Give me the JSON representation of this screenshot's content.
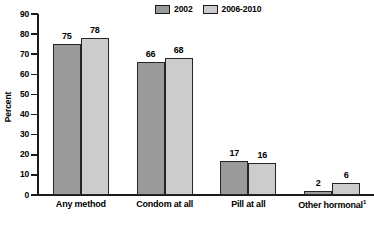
{
  "chart_data": {
    "type": "bar",
    "title": "",
    "subtitle": "",
    "xlabel": "",
    "ylabel": "Percent",
    "ylim": [
      0,
      90
    ],
    "ytick_step": 10,
    "yticks": [
      90,
      80,
      70,
      60,
      50,
      40,
      30,
      20,
      10,
      0
    ],
    "grid": false,
    "legend_position": "top-center",
    "categories": [
      "Any method",
      "Condom at all",
      "Pill at all",
      "Other hormonal"
    ],
    "category_footnotes": [
      "",
      "",
      "",
      "1"
    ],
    "series": [
      {
        "name": "2002",
        "color": "#9a9a9a",
        "values": [
          75,
          66,
          17,
          2
        ]
      },
      {
        "name": "2006-2010",
        "color": "#cccccc",
        "values": [
          78,
          68,
          16,
          6
        ]
      }
    ],
    "value_labels": {
      "2002": [
        "75",
        "66",
        "17",
        "2"
      ],
      "2006-2010": [
        "78",
        "68",
        "16",
        "6"
      ]
    },
    "axis_color": "#1a1a1a",
    "bar_border_color": "#262626",
    "background": "#ffffff"
  },
  "legend": {
    "entries": [
      {
        "label": "2002"
      },
      {
        "label": "2006-2010"
      }
    ]
  },
  "axis": {
    "y_title": "Percent",
    "y_tick_labels": [
      "90",
      "80",
      "70",
      "60",
      "50",
      "40",
      "30",
      "20",
      "10",
      "0"
    ]
  },
  "categories": {
    "labels": [
      "Any method",
      "Condom at all",
      "Pill at all",
      "Other hormonal"
    ],
    "footnote_marker": "1"
  }
}
